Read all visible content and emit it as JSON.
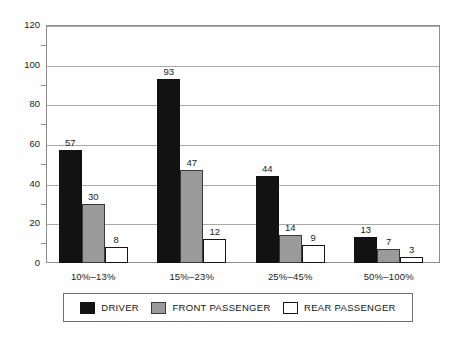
{
  "chart_data": {
    "type": "bar",
    "title": "",
    "subtitle": "",
    "xlabel": "",
    "ylabel": "",
    "ylim": [
      0,
      120
    ],
    "ytick_step": 20,
    "yminor_step": 10,
    "grid": true,
    "legend_position": "bottom",
    "categories": [
      "10%–13%",
      "15%–23%",
      "25%–45%",
      "50%–100%"
    ],
    "ytick_labels": [
      "0",
      "20",
      "40",
      "60",
      "80",
      "100",
      "120"
    ],
    "series": [
      {
        "name": "DRIVER",
        "color": "#121212",
        "values": [
          57,
          93,
          44,
          13
        ]
      },
      {
        "name": "FRONT PASSENGER",
        "color": "#9a9a9a",
        "values": [
          30,
          47,
          14,
          7
        ]
      },
      {
        "name": "REAR PASSENGER",
        "color": "#ffffff",
        "values": [
          8,
          12,
          9,
          3
        ]
      }
    ],
    "data_labels": [
      [
        "57",
        "93",
        "44",
        "13"
      ],
      [
        "30",
        "47",
        "14",
        "7"
      ],
      [
        "8",
        "12",
        "9",
        "3"
      ]
    ]
  },
  "legend": {
    "entries": [
      {
        "label": "DRIVER",
        "swatch": "driver"
      },
      {
        "label": "FRONT PASSENGER",
        "swatch": "front"
      },
      {
        "label": "REAR PASSENGER",
        "swatch": "rear"
      }
    ]
  }
}
